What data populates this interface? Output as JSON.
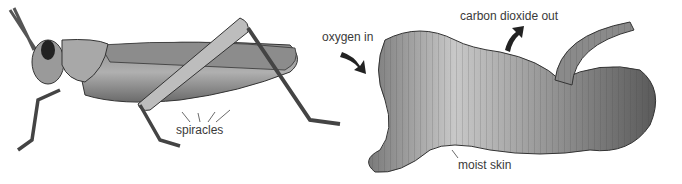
{
  "figure": {
    "subjects": [
      {
        "name": "grasshopper",
        "labels": [
          "spiracles"
        ]
      },
      {
        "name": "earthworm",
        "labels": [
          "oxygen in",
          "carbon dioxide out",
          "moist skin"
        ]
      }
    ]
  },
  "labels": {
    "spiracles": "spiracles",
    "oxygen_in": "oxygen in",
    "carbon_dioxide_out": "carbon dioxide out",
    "moist_skin": "moist skin"
  },
  "colors": {
    "ink": "#3a3a3a",
    "body_dark": "#6e6e6e",
    "body_mid": "#9a9a9a",
    "body_light": "#c8c8c8"
  }
}
